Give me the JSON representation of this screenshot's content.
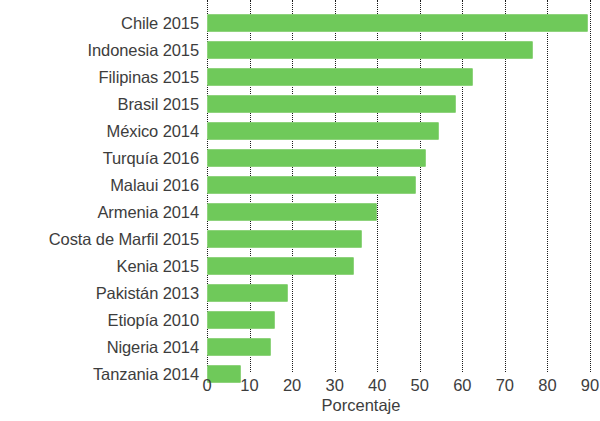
{
  "chart_data": {
    "type": "bar",
    "orientation": "horizontal",
    "title": "",
    "subtitle": "",
    "xlabel": "Porcentaje",
    "ylabel": "",
    "xlim": [
      0,
      90
    ],
    "xticks": [
      0,
      10,
      20,
      30,
      40,
      50,
      60,
      70,
      80,
      90
    ],
    "xtick_labels": [
      "0",
      "10",
      "20",
      "30",
      "40",
      "50",
      "60",
      "70",
      "80",
      "90"
    ],
    "grid": "vertical-dotted",
    "legend": null,
    "bar_color": "#6fc95a",
    "bar_edge_color": "#8fd37d",
    "text_color": "#3d3d3d",
    "background_color": "#ffffff",
    "categories": [
      "Chile 2015",
      "Indonesia 2015",
      "Filipinas 2015",
      "Brasil 2015",
      "México 2014",
      "Turquía 2016",
      "Malaui 2016",
      "Armenia 2014",
      "Costa de Marfil 2015",
      "Kenia 2015",
      "Pakistán 2013",
      "Etiopía 2010",
      "Nigeria 2014",
      "Tanzania 2014"
    ],
    "values": [
      89.5,
      76.5,
      62.5,
      58.5,
      54.5,
      51.5,
      49,
      40,
      36.5,
      34.5,
      19,
      16,
      15,
      8
    ]
  }
}
